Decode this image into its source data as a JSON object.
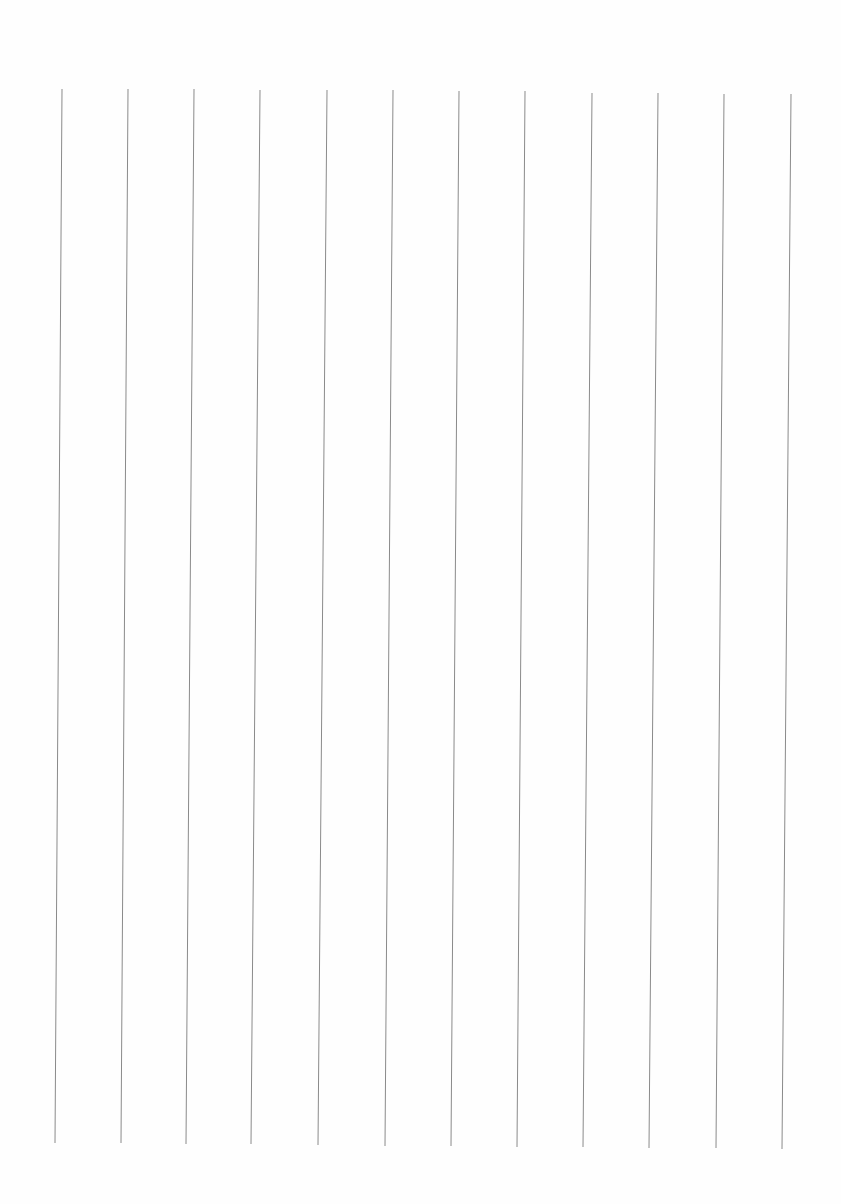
{
  "page": {
    "type": "blank ruled sheet with vertical lines",
    "line_color": "#8a8a8a",
    "background": "#fefefe",
    "line_count": 12,
    "lines": [
      {
        "x_top": 62,
        "y_top": 89,
        "x_bottom": 55,
        "y_bottom": 1143
      },
      {
        "x_top": 128,
        "y_top": 89,
        "x_bottom": 121,
        "y_bottom": 1143
      },
      {
        "x_top": 194,
        "y_top": 89,
        "x_bottom": 186,
        "y_bottom": 1144
      },
      {
        "x_top": 260,
        "y_top": 90,
        "x_bottom": 251,
        "y_bottom": 1144
      },
      {
        "x_top": 327,
        "y_top": 90,
        "x_bottom": 318,
        "y_bottom": 1145
      },
      {
        "x_top": 393,
        "y_top": 90,
        "x_bottom": 385,
        "y_bottom": 1146
      },
      {
        "x_top": 459,
        "y_top": 91,
        "x_bottom": 451,
        "y_bottom": 1146
      },
      {
        "x_top": 525,
        "y_top": 91,
        "x_bottom": 517,
        "y_bottom": 1147
      },
      {
        "x_top": 592,
        "y_top": 93,
        "x_bottom": 583,
        "y_bottom": 1147
      },
      {
        "x_top": 658,
        "y_top": 93,
        "x_bottom": 649,
        "y_bottom": 1148
      },
      {
        "x_top": 724,
        "y_top": 94,
        "x_bottom": 716,
        "y_bottom": 1148
      },
      {
        "x_top": 791,
        "y_top": 94,
        "x_bottom": 782,
        "y_bottom": 1149
      }
    ]
  }
}
